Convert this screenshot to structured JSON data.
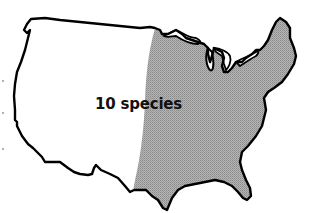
{
  "map": {
    "title": "",
    "region": "Contiguous United States",
    "label": "10 species",
    "shaded_region": "Eastern United States",
    "colors": {
      "outline": "#000000",
      "shading": "#a8a8a8",
      "background": "#ffffff",
      "text": "#111111"
    }
  }
}
